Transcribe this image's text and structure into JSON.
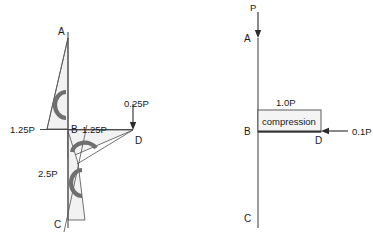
{
  "figure": {
    "background_color": "#ffffff",
    "line_color": "#4a4a4a",
    "fill_color": "#f2f2f2",
    "moment_arc_color": "#6f6f6f"
  },
  "left_diagram": {
    "name": "free-body-diagram",
    "nodes": {
      "a": "A",
      "b": "B",
      "c": "C",
      "d": "D"
    },
    "labels": {
      "reaction_left": "1.25P",
      "shear_right_of_b": "1.25P",
      "load_at_d": "0.25P",
      "moment_lower": "2.5P"
    },
    "moment_count": 3
  },
  "right_diagram": {
    "name": "axial-force-diagram",
    "nodes": {
      "a": "A",
      "b": "B",
      "c": "C",
      "d": "D"
    },
    "labels": {
      "top_load": "P",
      "axial_value": "1.0P",
      "region_label": "compression",
      "side_load": "0.1P"
    }
  }
}
